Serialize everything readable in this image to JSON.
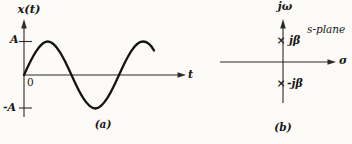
{
  "figure": {
    "background": "#fcfbf8",
    "ink_color": "#1a1a1a",
    "panel_a": {
      "y_axis_label": "x(t)",
      "amplitude_upper": "A",
      "amplitude_lower": "-A",
      "origin_label": "0",
      "x_axis_label": "t",
      "caption": "(a)",
      "curve": "sine wave, amplitude A, ~1.4 periods shown"
    },
    "panel_b": {
      "v_axis_label": "jω",
      "h_axis_label": "σ",
      "plane_label": "s-plane",
      "pole_marker": "×",
      "pole_upper_label": "jβ",
      "pole_lower_label": "-jβ",
      "caption": "(b)"
    }
  }
}
